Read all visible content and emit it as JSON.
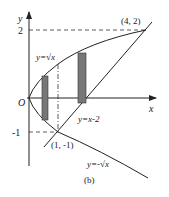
{
  "figure": {
    "caption": "(b)",
    "axes": {
      "x_label": "x",
      "y_label": "y",
      "origin_label": "O"
    },
    "ticks": {
      "y_2": "2",
      "y_neg1": "-1"
    },
    "points": {
      "top_intersection": "(4, 2)",
      "bottom_intersection": "(1, -1)"
    },
    "curves": {
      "upper_branch": "y=√x",
      "lower_branch": "y=-√x",
      "line": "y=x-2"
    },
    "colors": {
      "stroke": "#222222",
      "rect_fill": "#777777"
    }
  }
}
